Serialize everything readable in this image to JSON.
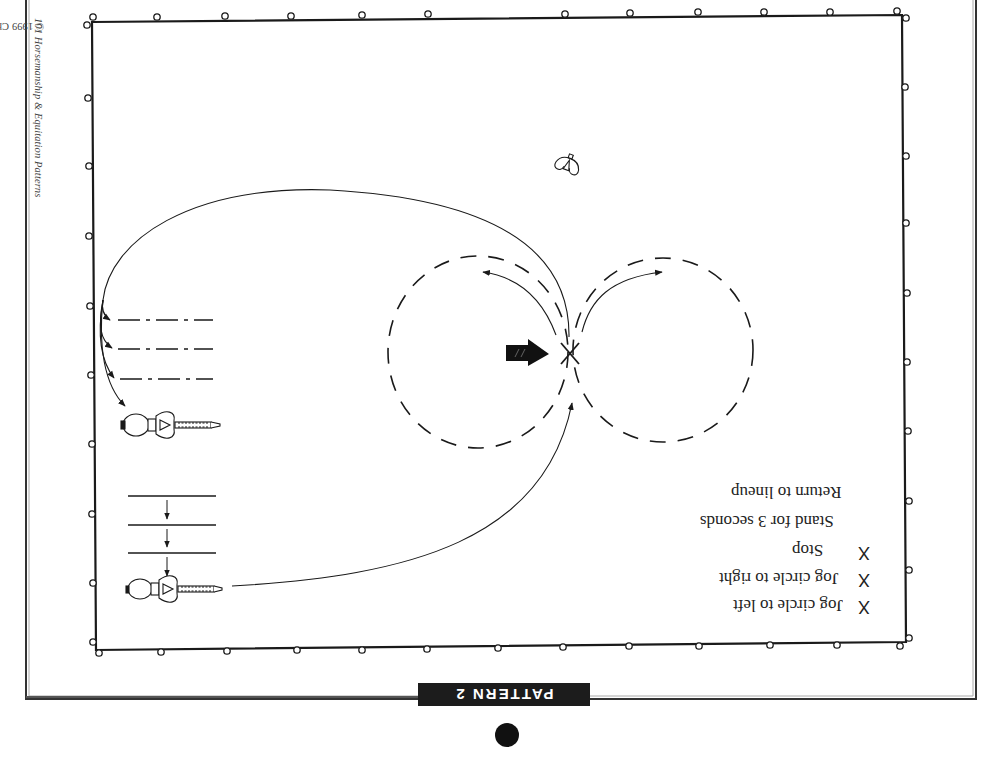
{
  "document": {
    "copyright": {
      "prefix": "© 1999 Cherry Hill ",
      "title": "101 Horsemanship & Equitation Patterns"
    },
    "pattern_label": "PATTERN 2",
    "orientation": "rotated 180°"
  },
  "instructions": [
    {
      "mark": "X",
      "text": "Jog circle to left"
    },
    {
      "mark": "X",
      "text": "Jog circle to right"
    },
    {
      "mark": "X",
      "text": "Stop"
    },
    {
      "mark": "",
      "text": "Stand for 3 seconds"
    },
    {
      "mark": "",
      "text": "Return to lineup"
    }
  ],
  "diagram": {
    "arena": {
      "type": "rectangle with fence posts"
    },
    "elements": [
      {
        "name": "figure-eight",
        "description": "Two dashed circles forming a figure eight"
      },
      {
        "name": "x-marker",
        "description": "X at center of figure eight"
      },
      {
        "name": "start-arrow",
        "description": "Bold arrow pointing to X"
      },
      {
        "name": "judge",
        "description": "Judge figure"
      },
      {
        "name": "lineup-start",
        "description": "Horse and rider in starting lineup with three solid lines and down arrows"
      },
      {
        "name": "lineup-return",
        "description": "Horse and rider in return lineup with three dash-dot lines"
      }
    ]
  },
  "colors": {
    "ink": "#1a1a1a",
    "label_bg": "#1c1c1c",
    "label_fg": "#ffffff",
    "frame": "#555555"
  }
}
